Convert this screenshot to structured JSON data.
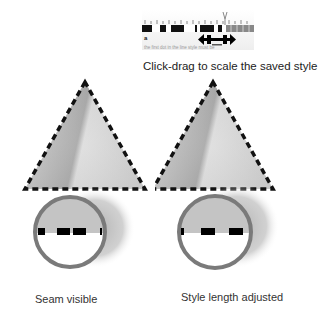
{
  "header_strip": {
    "description": "Ruler strip with dashed style pattern and drag-resize cursor",
    "faded_text": "the first dot in the line style must be"
  },
  "caption": "Click-drag to scale the saved style.",
  "panels": [
    {
      "id": "left",
      "label": "Seam visible",
      "state": "seam"
    },
    {
      "id": "right",
      "label": "Style length adjusted",
      "state": "adjusted"
    }
  ],
  "colors": {
    "dash": "#111111",
    "ring": "#7a7a7a",
    "shadow": "#bdbdbd",
    "fill_light": "#e6e6e6",
    "fill_dark": "#9a9a9a"
  }
}
